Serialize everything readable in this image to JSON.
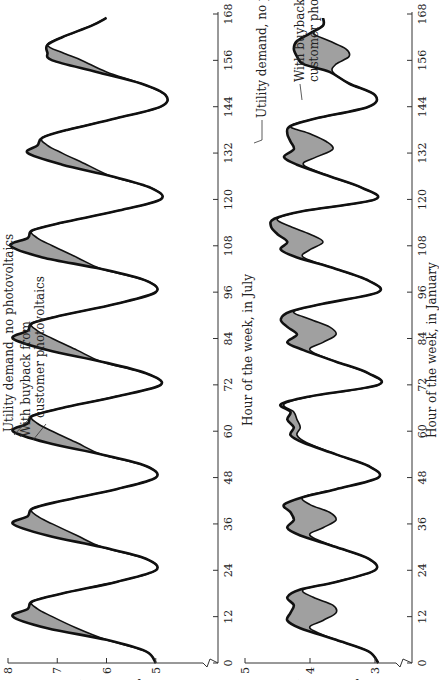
{
  "chart_data": [
    {
      "type": "area",
      "title": "",
      "xlabel": "Hour of the week, in July",
      "ylabel": "Utility demand, GW",
      "xlim": [
        0,
        168
      ],
      "ylim": [
        4,
        8
      ],
      "xticks": [
        0,
        12,
        24,
        36,
        48,
        60,
        72,
        84,
        96,
        108,
        120,
        132,
        144,
        156,
        168
      ],
      "yticks": [
        4,
        5,
        6,
        7,
        8
      ],
      "axis_break": "y-axis break between 4 and 5",
      "grid": false,
      "annotations": [
        "Utility demand, no photovoltaics",
        "With buyback from customer photovoltaics"
      ],
      "x": [
        0,
        3,
        6,
        9,
        12,
        14,
        16,
        18,
        21,
        24,
        27,
        30,
        33,
        36,
        38,
        40,
        42,
        45,
        48,
        51,
        54,
        57,
        60,
        62,
        64,
        66,
        69,
        72,
        75,
        78,
        81,
        84,
        86,
        88,
        90,
        93,
        96,
        99,
        102,
        105,
        108,
        110,
        112,
        114,
        117,
        120,
        123,
        126,
        129,
        132,
        134,
        136,
        138,
        141,
        144,
        147,
        150,
        153,
        156,
        158,
        160,
        162,
        165,
        167
      ],
      "series": [
        {
          "name": "Utility demand, no photovoltaics",
          "values": [
            5.0,
            5.2,
            6.0,
            7.2,
            7.9,
            7.6,
            7.5,
            6.9,
            5.8,
            5.0,
            5.2,
            6.1,
            7.2,
            7.9,
            7.6,
            7.5,
            6.9,
            5.8,
            5.0,
            5.2,
            6.1,
            7.2,
            7.9,
            7.6,
            7.5,
            6.9,
            5.8,
            4.9,
            5.2,
            6.1,
            7.2,
            7.9,
            7.6,
            7.5,
            6.9,
            5.8,
            5.0,
            5.2,
            6.1,
            7.3,
            7.95,
            7.6,
            7.5,
            6.9,
            5.8,
            4.9,
            5.1,
            5.9,
            6.9,
            7.6,
            7.4,
            7.3,
            6.8,
            5.8,
            4.9,
            4.8,
            5.3,
            6.2,
            7.1,
            7.2,
            7.2,
            6.9,
            6.3,
            6.0
          ]
        },
        {
          "name": "With buyback from customer photovoltaics",
          "values": [
            5.0,
            5.2,
            6.0,
            6.6,
            7.1,
            7.4,
            7.5,
            6.9,
            5.8,
            5.0,
            5.2,
            6.1,
            6.6,
            7.1,
            7.4,
            7.5,
            6.9,
            5.8,
            5.0,
            5.2,
            6.1,
            6.6,
            7.1,
            7.4,
            7.5,
            6.9,
            5.8,
            4.9,
            5.2,
            6.1,
            6.6,
            7.1,
            7.4,
            7.5,
            6.9,
            5.8,
            5.0,
            5.2,
            6.1,
            6.6,
            7.1,
            7.4,
            7.5,
            6.9,
            5.8,
            4.9,
            5.1,
            5.9,
            6.4,
            6.9,
            7.2,
            7.3,
            6.8,
            5.8,
            4.9,
            4.8,
            5.3,
            6.0,
            6.5,
            6.9,
            7.2,
            6.9,
            6.3,
            6.0
          ]
        }
      ]
    },
    {
      "type": "area",
      "title": "",
      "xlabel": "Hour of the week, in January",
      "ylabel": "Utility demand, GW",
      "xlim": [
        0,
        168
      ],
      "ylim": [
        3,
        5
      ],
      "xticks": [
        0,
        12,
        24,
        36,
        48,
        60,
        72,
        84,
        96,
        108,
        120,
        132,
        144,
        156,
        168
      ],
      "yticks": [
        3,
        4,
        5
      ],
      "axis_break": "y-axis break below 3",
      "grid": false,
      "annotations": [
        "Utility demand, no photovoltaics",
        "With buyback from customer photovoltaics"
      ],
      "x": [
        0,
        3,
        6,
        9,
        11,
        13,
        15,
        17,
        19,
        21,
        24,
        27,
        30,
        33,
        35,
        37,
        39,
        41,
        43,
        45,
        48,
        51,
        54,
        57,
        59,
        61,
        63,
        65,
        67,
        69,
        72,
        75,
        78,
        81,
        83,
        85,
        87,
        89,
        91,
        93,
        96,
        99,
        102,
        105,
        107,
        109,
        111,
        113,
        115,
        117,
        120,
        123,
        126,
        129,
        131,
        133,
        135,
        137,
        139,
        141,
        144,
        147,
        150,
        153,
        155,
        157,
        159,
        161,
        163,
        165,
        167
      ],
      "series": [
        {
          "name": "Utility demand, no photovoltaics",
          "values": [
            2.95,
            3.1,
            3.6,
            4.15,
            4.35,
            4.3,
            4.25,
            4.35,
            4.15,
            3.6,
            3.0,
            3.1,
            3.6,
            4.15,
            4.35,
            4.25,
            4.3,
            4.4,
            4.1,
            3.6,
            2.95,
            3.1,
            3.6,
            4.1,
            4.3,
            4.25,
            4.35,
            4.3,
            4.45,
            4.0,
            2.95,
            3.1,
            3.6,
            4.1,
            4.35,
            4.2,
            4.35,
            4.45,
            4.3,
            3.8,
            2.95,
            3.1,
            3.6,
            4.2,
            4.45,
            4.35,
            4.5,
            4.6,
            4.55,
            4.1,
            3.0,
            3.2,
            3.7,
            4.2,
            4.4,
            4.25,
            4.3,
            4.35,
            4.3,
            3.9,
            3.1,
            3.0,
            3.4,
            3.7,
            4.1,
            4.2,
            4.25,
            4.2,
            4.0,
            3.8,
            3.8
          ]
        },
        {
          "name": "With buyback from customer photovoltaics",
          "values": [
            2.95,
            3.1,
            3.6,
            4.0,
            3.8,
            3.6,
            3.65,
            3.95,
            4.1,
            3.6,
            3.0,
            3.1,
            3.6,
            4.0,
            3.8,
            3.6,
            3.7,
            4.0,
            4.1,
            3.6,
            2.95,
            3.1,
            3.6,
            4.05,
            4.2,
            4.15,
            4.2,
            4.25,
            4.4,
            4.0,
            2.95,
            3.1,
            3.6,
            4.0,
            3.8,
            3.6,
            3.7,
            4.0,
            4.25,
            3.8,
            2.95,
            3.1,
            3.6,
            4.1,
            4.0,
            3.8,
            4.0,
            4.3,
            4.5,
            4.1,
            3.0,
            3.2,
            3.7,
            4.1,
            3.9,
            3.65,
            3.75,
            4.0,
            4.3,
            3.9,
            3.1,
            3.0,
            3.4,
            3.65,
            3.6,
            3.4,
            3.45,
            3.7,
            3.95,
            3.8,
            3.8
          ]
        }
      ]
    }
  ],
  "labels": {
    "july_xlabel": "Hour of the week, in July",
    "january_xlabel": "Hour of the week, in January",
    "ylabel": "Utility demand, GW",
    "july_ann_base": "Utility demand, no photovoltaics",
    "july_ann_buy_1": "With buyback from",
    "july_ann_buy_2": "customer photovoltaics",
    "jan_ann_base": "Utility demand, no photovoltaics",
    "jan_ann_buy_1": "With buyback from",
    "jan_ann_buy_2": "customer photovoltaics"
  },
  "colors": {
    "line": "#111111",
    "fill": "#a0a0a0",
    "axis": "#333333"
  }
}
